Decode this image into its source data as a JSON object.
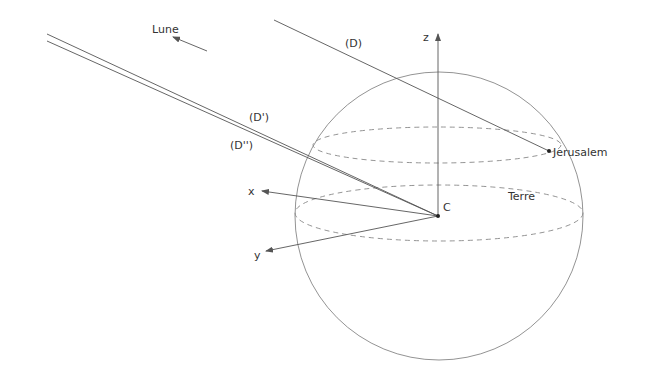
{
  "diagram": {
    "title": "",
    "labels": {
      "moon": "Lune",
      "line_d": "(D)",
      "line_d_prime": "(D')",
      "line_d_second": "(D'')",
      "axis_z": "z",
      "axis_x": "x",
      "axis_y": "y",
      "center": "C",
      "earth": "Terre",
      "city": "Jerusalem"
    },
    "colors": {
      "background": "#ffffff",
      "stroke": "#555555",
      "text": "#333333"
    }
  }
}
